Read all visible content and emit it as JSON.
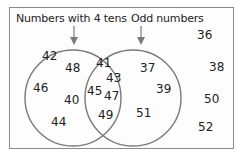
{
  "sets": {
    "left": {
      "label": "Numbers with 4 tens",
      "only": [
        "42",
        "48",
        "46",
        "40",
        "44"
      ]
    },
    "right": {
      "label": "Odd numbers",
      "only": [
        "37",
        "39",
        "51"
      ]
    },
    "intersection": [
      "41",
      "43",
      "45",
      "47",
      "49"
    ],
    "outside": [
      "36",
      "38",
      "50",
      "52"
    ]
  },
  "colors": {
    "circle_stroke": "#7a7a7a",
    "frame_stroke": "#8a8a8a",
    "text": "#222222"
  }
}
